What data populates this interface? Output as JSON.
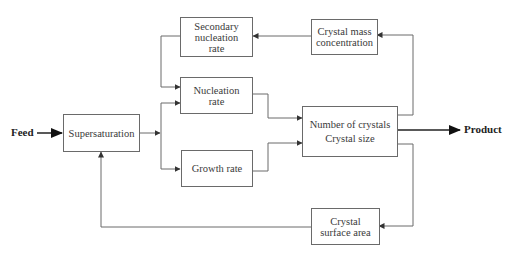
{
  "diagram": {
    "inputs": {
      "feed": "Feed"
    },
    "outputs": {
      "product": "Product"
    },
    "nodes": {
      "supersaturation": {
        "lines": [
          "Supersaturation"
        ]
      },
      "secondary_nucleation": {
        "lines": [
          "Secondary",
          "nucleation",
          "rate"
        ]
      },
      "nucleation": {
        "lines": [
          "Nucleation",
          "rate"
        ]
      },
      "growth": {
        "lines": [
          "Growth rate"
        ]
      },
      "crystals": {
        "lines": [
          "Number of crystals",
          "Crystal size"
        ]
      },
      "mass": {
        "lines": [
          "Crystal mass",
          "concentration"
        ]
      },
      "surface": {
        "lines": [
          "Crystal",
          "surface area"
        ]
      }
    },
    "edges": [
      {
        "from": "feed",
        "to": "supersaturation"
      },
      {
        "from": "supersaturation",
        "to": "nucleation"
      },
      {
        "from": "supersaturation",
        "to": "growth"
      },
      {
        "from": "secondary_nucleation",
        "to": "nucleation"
      },
      {
        "from": "nucleation",
        "to": "crystals"
      },
      {
        "from": "growth",
        "to": "crystals"
      },
      {
        "from": "crystals",
        "to": "product"
      },
      {
        "from": "crystals",
        "to": "mass"
      },
      {
        "from": "mass",
        "to": "secondary_nucleation"
      },
      {
        "from": "crystals",
        "to": "surface"
      },
      {
        "from": "surface",
        "to": "supersaturation"
      }
    ],
    "colors": {
      "line": "#6a6a6a",
      "text": "#3a3a3a",
      "bold_text": "#222222"
    }
  }
}
